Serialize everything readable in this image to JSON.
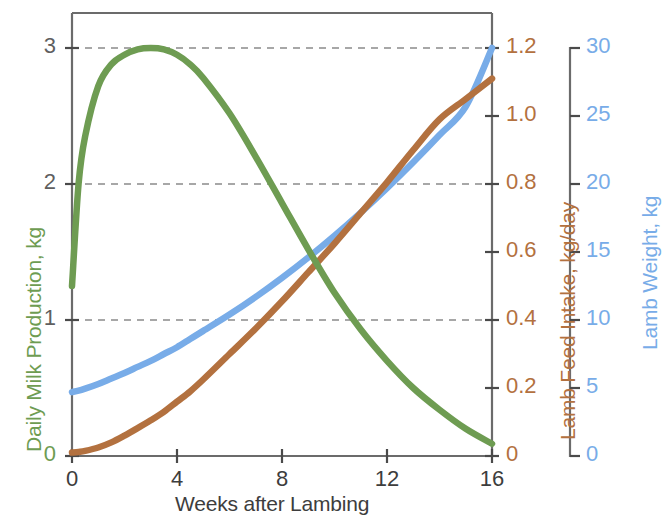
{
  "chart_data": {
    "type": "line",
    "title": "",
    "xlabel": "Weeks after Lambing",
    "xlim": [
      0,
      16
    ],
    "xticks": [
      0,
      4,
      8,
      12,
      16
    ],
    "xtick_labels": [
      "0",
      "4",
      "8",
      "12",
      "16"
    ],
    "grid": true,
    "grid_axis": "y",
    "legend": "none",
    "axes": [
      {
        "id": "milk",
        "label": "Daily Milk Production, kg",
        "position": "left",
        "color": "#6e9c52",
        "lim": [
          0,
          3.0
        ],
        "ticks": [
          0,
          1,
          2,
          3
        ],
        "tick_labels": [
          "0",
          "1",
          "2",
          "3"
        ]
      },
      {
        "id": "feed",
        "label": "Lamb Feed Intake, kg/day",
        "position": "right-inner",
        "color": "#b3713f",
        "lim": [
          0,
          1.2
        ],
        "ticks": [
          0,
          0.2,
          0.4,
          0.6,
          0.8,
          1.0,
          1.2
        ],
        "tick_labels": [
          "0",
          "0.2",
          "0.4",
          "0.6",
          "0.8",
          "1.0",
          "1.2"
        ]
      },
      {
        "id": "weight",
        "label": "Lamb Weight, kg",
        "position": "right-outer",
        "color": "#78ace8",
        "lim": [
          0,
          30
        ],
        "ticks": [
          0,
          5,
          10,
          15,
          20,
          25,
          30
        ],
        "tick_labels": [
          "0",
          "5",
          "10",
          "15",
          "20",
          "25",
          "30"
        ]
      }
    ],
    "x": [
      0,
      0.25,
      0.5,
      1,
      1.5,
      2,
      2.5,
      3,
      3.5,
      4,
      4.5,
      5,
      6,
      7,
      8,
      9,
      10,
      11,
      12,
      13,
      14,
      15,
      16
    ],
    "series": [
      {
        "name": "Daily Milk Production, kg",
        "axis": "milk",
        "color": "#6e9c52",
        "unit": "kg",
        "values": [
          1.25,
          2.0,
          2.35,
          2.72,
          2.88,
          2.95,
          2.99,
          3.0,
          2.99,
          2.95,
          2.88,
          2.78,
          2.52,
          2.2,
          1.86,
          1.52,
          1.2,
          0.93,
          0.7,
          0.5,
          0.34,
          0.2,
          0.09
        ]
      },
      {
        "name": "Lamb Weight, kg",
        "axis": "weight",
        "color": "#78ace8",
        "unit": "kg",
        "values": [
          4.7,
          4.8,
          4.95,
          5.3,
          5.7,
          6.1,
          6.55,
          7.0,
          7.5,
          8.0,
          8.6,
          9.2,
          10.4,
          11.7,
          13.1,
          14.6,
          16.2,
          17.9,
          19.7,
          21.6,
          23.6,
          25.7,
          30.0
        ]
      },
      {
        "name": "Lamb Feed Intake, kg/day",
        "axis": "feed",
        "color": "#b3713f",
        "unit": "kg/day",
        "values": [
          0.01,
          0.012,
          0.015,
          0.025,
          0.04,
          0.06,
          0.082,
          0.105,
          0.13,
          0.16,
          0.19,
          0.225,
          0.3,
          0.375,
          0.455,
          0.54,
          0.625,
          0.715,
          0.805,
          0.9,
          0.99,
          1.05,
          1.11
        ]
      }
    ]
  },
  "axis_titles": {
    "left": "Daily Milk Production, kg",
    "right_inner": "Lamb Feed Intake, kg/day",
    "right_outer": "Lamb Weight, kg",
    "bottom": "Weeks after Lambing"
  },
  "ticks": {
    "left": [
      "3",
      "2",
      "1",
      "0"
    ],
    "bottom": [
      "0",
      "4",
      "8",
      "12",
      "16"
    ],
    "feed": [
      "1.2",
      "1.0",
      "0.8",
      "0.6",
      "0.4",
      "0.2",
      "0"
    ],
    "weight": [
      "30",
      "25",
      "20",
      "15",
      "10",
      "5",
      "0"
    ]
  },
  "colors": {
    "milk": "#6e9c52",
    "feed": "#b3713f",
    "weight": "#78ace8",
    "axis": "#6b6b6b",
    "grid": "#8a8a8a",
    "text": "#3d3d3d"
  }
}
